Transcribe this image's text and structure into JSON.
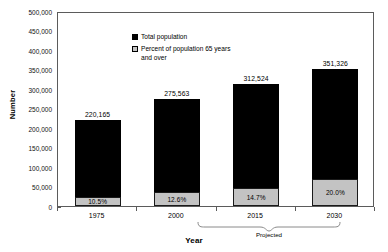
{
  "chart_data": {
    "type": "bar",
    "title": "",
    "xlabel": "Year",
    "ylabel": "Number",
    "ylim": [
      0,
      500000
    ],
    "ytick_labels": [
      "500,000",
      "450,000",
      "400,000",
      "350,000",
      "300,000",
      "250,000",
      "200,000",
      "150,000",
      "100,000",
      "50,000",
      "0"
    ],
    "ytick_values": [
      500000,
      450000,
      400000,
      350000,
      300000,
      250000,
      200000,
      150000,
      100000,
      50000,
      0
    ],
    "grid": false,
    "legend_position": "inside-top-left",
    "categories": [
      "1975",
      "2000",
      "2015",
      "2030"
    ],
    "series": [
      {
        "name": "Total population",
        "color": "#000000",
        "values": [
          220165,
          275563,
          312524,
          351326
        ],
        "value_labels": [
          "220,165",
          "275,563",
          "312,524",
          "351,326"
        ]
      },
      {
        "name": "Percent of population 65 years and over",
        "color": "#c3c3c3",
        "values": [
          10.5,
          12.6,
          14.7,
          20.0
        ],
        "value_labels": [
          "10.5%",
          "12.6%",
          "14.7%",
          "20.0%"
        ]
      }
    ],
    "annotations": [
      {
        "text": "Projected",
        "spans": [
          "2015",
          "2030"
        ],
        "style": "curly-brace-below-axis"
      }
    ]
  },
  "legend": {
    "items": [
      {
        "label": "Total population",
        "swatch": "black-square"
      },
      {
        "label": "Percent of population 65 years and over",
        "swatch": "gray-square"
      }
    ]
  },
  "axes": {
    "y_title": "Number",
    "x_title": "Year"
  },
  "annotation": {
    "projected_label": "Projected"
  }
}
